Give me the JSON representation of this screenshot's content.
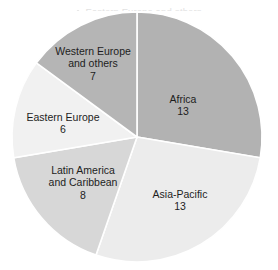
{
  "caption": {
    "bullet_icon": "open-circle-bullet",
    "text": "Eastern Europe and others"
  },
  "chart_data": {
    "type": "pie",
    "title": "",
    "subtitle": "",
    "xlabel": "",
    "ylabel": "",
    "grid": false,
    "legend": "none (labels drawn inside slices)",
    "total": 47,
    "start_angle_deg": 0,
    "direction": "clockwise",
    "units": "count",
    "categories": [
      "Africa",
      "Asia-Pacific",
      "Latin America and Caribbean",
      "Eastern Europe",
      "Western Europe and others"
    ],
    "values": [
      13,
      13,
      8,
      6,
      7
    ],
    "slices": [
      {
        "label": "Africa",
        "label_line_1": "Africa",
        "value": 13,
        "value_text": "13",
        "percent": 27.7,
        "angle_deg": 99.6,
        "start_deg": 0,
        "end_deg": 99.6,
        "color": "#b2b2b2"
      },
      {
        "label": "Asia-Pacific",
        "label_line_1": "Asia-Pacific",
        "value": 13,
        "value_text": "13",
        "percent": 27.7,
        "angle_deg": 99.6,
        "start_deg": 99.6,
        "end_deg": 199.1,
        "color": "#ececec"
      },
      {
        "label": "Latin America and Caribbean",
        "label_line_1": "Latin America",
        "label_line_2": "and Caribbean",
        "value": 8,
        "value_text": "8",
        "percent": 17.0,
        "angle_deg": 61.3,
        "start_deg": 199.1,
        "end_deg": 260.4,
        "color": "#d7d7d7"
      },
      {
        "label": "Eastern Europe",
        "label_line_1": "Eastern Europe",
        "value": 6,
        "value_text": "6",
        "percent": 12.8,
        "angle_deg": 46.0,
        "start_deg": 260.4,
        "end_deg": 306.4,
        "color": "#f1f1f1"
      },
      {
        "label": "Western Europe and others",
        "label_line_1": "Western Europe",
        "label_line_2": "and others",
        "value": 7,
        "value_text": "7",
        "percent": 14.9,
        "angle_deg": 53.6,
        "start_deg": 306.4,
        "end_deg": 360,
        "color": "#b5b5b5"
      }
    ],
    "geometry": {
      "center_x": 137,
      "center_y": 137,
      "radius": 125
    },
    "colors": {
      "separator": "#ffffff",
      "background": "#ffffff",
      "label_text": "#1d1d1d"
    }
  }
}
